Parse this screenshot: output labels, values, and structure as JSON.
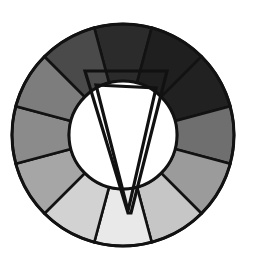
{
  "figure": {
    "background_color": "#ffffff",
    "width": 255,
    "height": 265
  },
  "chart_data": {
    "type": "pie",
    "xlabel": "",
    "ylabel": "",
    "legend_position": "none",
    "grid": false,
    "geometry": {
      "center_x": 123,
      "center_y": 135,
      "outer_radius": 111,
      "inner_radius": 54,
      "segment_count": 12,
      "segment_angle_deg": 30,
      "start_angle_deg": -105
    },
    "categories": [
      "seg-1",
      "seg-2",
      "seg-3",
      "seg-4",
      "seg-5",
      "seg-6",
      "seg-7",
      "seg-8",
      "seg-9",
      "seg-10",
      "seg-11",
      "seg-12"
    ],
    "values": [
      30,
      30,
      30,
      30,
      30,
      30,
      30,
      30,
      30,
      30,
      30,
      30
    ],
    "colors": [
      "#2b2b2b",
      "#1f1f1f",
      "#212121",
      "#6f6f6f",
      "#9b9b9b",
      "#c6c6c6",
      "#e9e9e9",
      "#d2d2d2",
      "#a6a6a6",
      "#8b8b8b",
      "#7d7d7d",
      "#4a4a4a"
    ],
    "slice_center_angles_deg": [
      -90,
      -60,
      -30,
      0,
      30,
      60,
      90,
      120,
      150,
      180,
      210,
      240
    ],
    "stroke_color": "#121212",
    "stroke_width": 2.6,
    "hole_color": "#ffffff"
  },
  "selector": {
    "name": "triad-selector",
    "outline_color": "#111111",
    "stroke_width": 3.2,
    "apex_x": 128,
    "apex_y": 213,
    "outer_polygon_points": "84,71 167,71 167,85 128,213 128,213 84,85",
    "outer_trapezoid_points": "85,71 167,71 131,213 128,213",
    "inner_triangle_points": "96,85 156,88 128,211"
  },
  "elements": {
    "wheel_label": "color-wheel",
    "hole_label": "wheel-center-hole",
    "selector_label": "color-selector-triangle"
  }
}
